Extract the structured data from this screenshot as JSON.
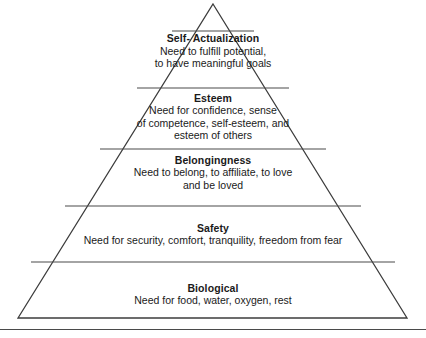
{
  "diagram": {
    "type": "pyramid",
    "name": "Maslow's hierarchy of needs",
    "tier_count": 5,
    "colors": {
      "background": "#ffffff",
      "outline": "#3c3c3c",
      "divider": "#4a4a4a",
      "text": "#1a1a1a"
    },
    "tiers": [
      {
        "id": "self-actualization",
        "level": 5,
        "title_line1": "Self-",
        "title_line2": "Actualization",
        "desc_line1": "Need to fulfill potential,",
        "desc_line2": "to have meaningful goals"
      },
      {
        "id": "esteem",
        "level": 4,
        "title": "Esteem",
        "desc_line1": "Need for confidence, sense",
        "desc_line2": "of competence, self-esteem, and",
        "desc_line3": "esteem of others"
      },
      {
        "id": "belongingness",
        "level": 3,
        "title": "Belongingness",
        "desc_line1": "Need to belong, to affiliate, to love",
        "desc_line2": "and be loved"
      },
      {
        "id": "safety",
        "level": 2,
        "title": "Safety",
        "desc_line1": "Need for security, comfort, tranquility, freedom from fear"
      },
      {
        "id": "biological",
        "level": 1,
        "title": "Biological",
        "desc_line1": "Need for food, water, oxygen, rest"
      }
    ]
  }
}
